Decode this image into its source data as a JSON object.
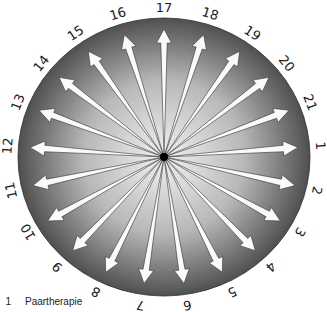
{
  "diagram": {
    "type": "radial-arrow-wheel",
    "center": {
      "x": 164,
      "y": 157
    },
    "radius": {
      "rx": 146,
      "ry": 139
    },
    "gradient": {
      "inner": "#f2f2f2",
      "mid": "#b8b8b8",
      "outer": "#505050"
    },
    "arrow_color": "#fafafa",
    "arrow_outline": "#333333",
    "hub_color": "#000000",
    "spoke_count": 21,
    "start_label": "17",
    "start_angle_deg": -90,
    "labels": [
      "17",
      "18",
      "19",
      "20",
      "21",
      "1",
      "2",
      "3",
      "4",
      "5",
      "6",
      "7",
      "8",
      "9",
      "10",
      "11",
      "12",
      "13",
      "14",
      "15",
      "16"
    ]
  },
  "legend": {
    "items": [
      {
        "number": "1",
        "label": "Paartherapie"
      }
    ]
  }
}
